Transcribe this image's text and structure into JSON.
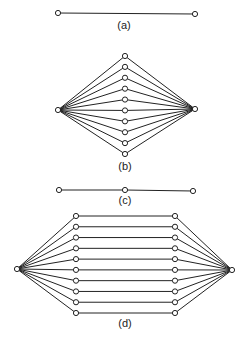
{
  "figure": {
    "panels": [
      {
        "id": "a",
        "caption": "(a)",
        "description": "Single edge between two terminal nodes",
        "middle_columns": 0,
        "parallel_paths": 1
      },
      {
        "id": "b",
        "caption": "(b)",
        "description": "Two terminal nodes connected through 10 parallel intermediate nodes",
        "middle_columns": 1,
        "parallel_paths": 10
      },
      {
        "id": "c",
        "caption": "(c)",
        "description": "Path of two edges through one intermediate node",
        "middle_columns": 1,
        "parallel_paths": 1
      },
      {
        "id": "d",
        "caption": "(d)",
        "description": "Two terminal nodes connected through 10 parallel paths of two intermediate nodes each",
        "middle_columns": 2,
        "parallel_paths": 10
      }
    ],
    "colors": {
      "stroke": "#222222",
      "node_fill": "#ffffff",
      "background": "#ffffff"
    }
  }
}
